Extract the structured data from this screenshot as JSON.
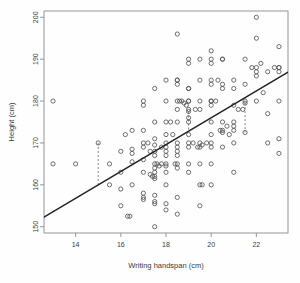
{
  "chart_data": {
    "type": "scatter",
    "title": "",
    "xlabel": "Writing handspan (cm)",
    "ylabel": "Height (cm)",
    "xlim": [
      12.6,
      23.4
    ],
    "ylim": [
      148.5,
      201.5
    ],
    "xticks": [
      14,
      16,
      18,
      20,
      22
    ],
    "yticks": [
      150,
      160,
      170,
      180,
      190,
      200
    ],
    "grid": false,
    "legend": null,
    "point_style": {
      "marker": "open-circle",
      "radius": 2.1,
      "stroke": "#555555",
      "fill": "none"
    },
    "regression_line": {
      "label": "least-squares fit",
      "x": [
        12.6,
        23.4
      ],
      "y": [
        152.3,
        186.9
      ],
      "slope": 3.2,
      "intercept": 112.0,
      "color": "#222222",
      "width": 1.3
    },
    "residual_segments": [
      {
        "x": 15.0,
        "y_point": 170.0,
        "y_line": 160.0
      },
      {
        "x": 19.0,
        "y_point": 177.5,
        "y_line": 173.0
      },
      {
        "x": 21.5,
        "y_point": 179.5,
        "y_line": 172.5
      }
    ],
    "points": [
      [
        13.0,
        180.0
      ],
      [
        13.0,
        165.0
      ],
      [
        14.0,
        165.0
      ],
      [
        15.0,
        170.0
      ],
      [
        15.5,
        160.0
      ],
      [
        15.5,
        165.0
      ],
      [
        16.0,
        168.0
      ],
      [
        16.0,
        163.0
      ],
      [
        16.0,
        159.0
      ],
      [
        16.0,
        155.0
      ],
      [
        16.2,
        172.0
      ],
      [
        16.3,
        152.5
      ],
      [
        16.4,
        152.5
      ],
      [
        16.5,
        167.5
      ],
      [
        16.5,
        168.5
      ],
      [
        16.5,
        165.5
      ],
      [
        16.5,
        160.0
      ],
      [
        16.5,
        173.0
      ],
      [
        17.0,
        180.0
      ],
      [
        17.0,
        179.0
      ],
      [
        17.0,
        173.0
      ],
      [
        17.0,
        170.0
      ],
      [
        17.0,
        169.0
      ],
      [
        17.0,
        166.0
      ],
      [
        17.0,
        163.0
      ],
      [
        17.0,
        158.0
      ],
      [
        17.0,
        157.0
      ],
      [
        17.0,
        156.5
      ],
      [
        17.2,
        170.0
      ],
      [
        17.3,
        168.0
      ],
      [
        17.3,
        162.5
      ],
      [
        17.4,
        162.0
      ],
      [
        17.5,
        183.0
      ],
      [
        17.5,
        175.0
      ],
      [
        17.5,
        171.0
      ],
      [
        17.5,
        169.5
      ],
      [
        17.5,
        168.0
      ],
      [
        17.5,
        167.0
      ],
      [
        17.5,
        165.0
      ],
      [
        17.5,
        164.0
      ],
      [
        17.5,
        163.0
      ],
      [
        17.5,
        162.0
      ],
      [
        17.5,
        161.5
      ],
      [
        17.5,
        157.5
      ],
      [
        17.5,
        156.0
      ],
      [
        17.5,
        155.5
      ],
      [
        17.5,
        150.0
      ],
      [
        17.6,
        165.0
      ],
      [
        17.7,
        164.5
      ],
      [
        17.8,
        169.0
      ],
      [
        17.8,
        165.0
      ],
      [
        18.0,
        185.0
      ],
      [
        18.0,
        180.0
      ],
      [
        18.0,
        175.0
      ],
      [
        18.0,
        172.0
      ],
      [
        18.0,
        170.0
      ],
      [
        18.0,
        169.0
      ],
      [
        18.0,
        168.0
      ],
      [
        18.0,
        167.0
      ],
      [
        18.0,
        165.0
      ],
      [
        18.0,
        164.5
      ],
      [
        18.0,
        163.0
      ],
      [
        18.0,
        160.0
      ],
      [
        18.0,
        155.5
      ],
      [
        18.2,
        175.0
      ],
      [
        18.3,
        172.0
      ],
      [
        18.4,
        165.0
      ],
      [
        18.5,
        196.0
      ],
      [
        18.5,
        185.0
      ],
      [
        18.5,
        185.0
      ],
      [
        18.5,
        184.0
      ],
      [
        18.5,
        180.0
      ],
      [
        18.5,
        178.0
      ],
      [
        18.5,
        175.0
      ],
      [
        18.5,
        170.0
      ],
      [
        18.5,
        169.0
      ],
      [
        18.5,
        168.0
      ],
      [
        18.5,
        167.0
      ],
      [
        18.5,
        165.0
      ],
      [
        18.5,
        164.0
      ],
      [
        18.5,
        157.0
      ],
      [
        18.6,
        180.0
      ],
      [
        18.7,
        180.0
      ],
      [
        18.8,
        179.5
      ],
      [
        18.9,
        179.0
      ],
      [
        19.0,
        190.0
      ],
      [
        19.0,
        189.0
      ],
      [
        19.0,
        183.0
      ],
      [
        19.0,
        183.0
      ],
      [
        19.0,
        180.0
      ],
      [
        19.0,
        180.0
      ],
      [
        19.0,
        178.0
      ],
      [
        19.0,
        177.5
      ],
      [
        19.0,
        176.0
      ],
      [
        19.0,
        175.0
      ],
      [
        19.0,
        172.0
      ],
      [
        19.0,
        170.0
      ],
      [
        19.0,
        169.0
      ],
      [
        19.0,
        165.0
      ],
      [
        19.0,
        163.0
      ],
      [
        19.2,
        170.0
      ],
      [
        19.3,
        178.0
      ],
      [
        19.4,
        169.0
      ],
      [
        19.5,
        190.0
      ],
      [
        19.5,
        185.0
      ],
      [
        19.5,
        180.0
      ],
      [
        19.5,
        178.0
      ],
      [
        19.5,
        170.0
      ],
      [
        19.5,
        169.0
      ],
      [
        19.5,
        165.0
      ],
      [
        19.5,
        155.0
      ],
      [
        19.6,
        169.5
      ],
      [
        19.8,
        170.0
      ],
      [
        20.0,
        192.0
      ],
      [
        20.0,
        190.0
      ],
      [
        20.0,
        189.0
      ],
      [
        20.0,
        185.0
      ],
      [
        20.0,
        184.0
      ],
      [
        20.0,
        180.0
      ],
      [
        20.0,
        180.0
      ],
      [
        20.0,
        179.0
      ],
      [
        20.0,
        175.0
      ],
      [
        20.0,
        172.0
      ],
      [
        20.0,
        170.0
      ],
      [
        20.0,
        169.0
      ],
      [
        20.0,
        165.0
      ],
      [
        20.2,
        180.0
      ],
      [
        20.3,
        185.0
      ],
      [
        20.4,
        173.0
      ],
      [
        20.5,
        190.0
      ],
      [
        20.5,
        190.0
      ],
      [
        20.5,
        184.0
      ],
      [
        20.5,
        183.0
      ],
      [
        20.5,
        175.0
      ],
      [
        20.5,
        173.0
      ],
      [
        20.5,
        172.5
      ],
      [
        20.5,
        169.0
      ],
      [
        20.7,
        174.0
      ],
      [
        20.8,
        172.0
      ],
      [
        21.0,
        185.0
      ],
      [
        21.0,
        183.0
      ],
      [
        21.0,
        179.0
      ],
      [
        21.0,
        175.0
      ],
      [
        21.0,
        174.0
      ],
      [
        21.0,
        173.0
      ],
      [
        21.0,
        170.0
      ],
      [
        21.2,
        178.0
      ],
      [
        21.4,
        178.0
      ],
      [
        21.5,
        190.0
      ],
      [
        21.5,
        184.0
      ],
      [
        21.5,
        180.0
      ],
      [
        21.5,
        179.5
      ],
      [
        21.5,
        172.5
      ],
      [
        21.8,
        188.0
      ],
      [
        22.0,
        200.0
      ],
      [
        22.0,
        195.0
      ],
      [
        22.0,
        188.0
      ],
      [
        22.0,
        187.0
      ],
      [
        22.0,
        186.0
      ],
      [
        22.0,
        180.0
      ],
      [
        22.2,
        189.0
      ],
      [
        22.3,
        182.0
      ],
      [
        22.5,
        187.0
      ],
      [
        22.5,
        177.0
      ],
      [
        22.5,
        170.0
      ],
      [
        23.0,
        193.0
      ],
      [
        23.0,
        188.0
      ],
      [
        23.0,
        188.0
      ],
      [
        23.0,
        187.0
      ],
      [
        23.0,
        180.0
      ],
      [
        23.0,
        171.0
      ],
      [
        23.0,
        167.5
      ],
      [
        22.8,
        188.0
      ],
      [
        21.0,
        163.0
      ],
      [
        20.0,
        160.0
      ],
      [
        19.6,
        160.0
      ],
      [
        19.5,
        160.0
      ],
      [
        18.0,
        154.0
      ],
      [
        18.5,
        153.0
      ]
    ]
  }
}
